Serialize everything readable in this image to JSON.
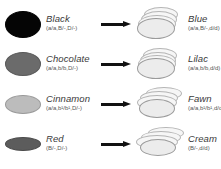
{
  "diagram": {
    "arrow_icon": "right-arrow-icon",
    "rows": [
      {
        "source": {
          "phenotype": "Black",
          "genotype": "(a/a,B/-,D/-)",
          "swatch_color": "#050505",
          "swatch_border": "#050505",
          "swatch_w": 36,
          "swatch_h": 27
        },
        "result": {
          "phenotype": "Blue",
          "genotype": "(a/a,B/-,d/d)",
          "disc_style": "tight-stack"
        }
      },
      {
        "source": {
          "phenotype": "Chocolate",
          "genotype": "(a/a,b/b,D/-)",
          "swatch_color": "#6b6b6b",
          "swatch_border": "#5a5a5a",
          "swatch_w": 36,
          "swatch_h": 24
        },
        "result": {
          "phenotype": "Lilac",
          "genotype": "(a/a,b/b,d/d)",
          "disc_style": "tight-stack"
        }
      },
      {
        "source": {
          "phenotype": "Cinnamon",
          "genotype": "(a/a,b¹/b¹,D/-)",
          "swatch_color": "#bcbcbc",
          "swatch_border": "#9a9a9a",
          "swatch_w": 36,
          "swatch_h": 19
        },
        "result": {
          "phenotype": "Fawn",
          "genotype": "(a/a,b¹/b¹,d/d)",
          "disc_style": "spread-stack"
        }
      },
      {
        "source": {
          "phenotype": "Red",
          "genotype": "(B/-,D/-)",
          "swatch_color": "#5c5c5c",
          "swatch_border": "#4a4a4a",
          "swatch_w": 36,
          "swatch_h": 14
        },
        "result": {
          "phenotype": "Cream",
          "genotype": "(B/-,d/d)",
          "disc_style": "spread-stack"
        }
      }
    ]
  },
  "colors": {
    "text": "#3a3a3a",
    "genotype_text": "#555555",
    "arrow": "#111111",
    "disc_outline": "#9a9a9a",
    "disc_fill": "#ececec",
    "background": "#ffffff"
  }
}
